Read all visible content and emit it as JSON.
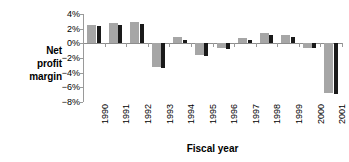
{
  "chart_data": {
    "type": "bar",
    "title": "",
    "xlabel": "Fiscal year",
    "ylabel": "Net profit margin",
    "ylabel_lines": [
      "Net",
      "profit",
      "margin"
    ],
    "categories": [
      "1990",
      "1991",
      "1992",
      "1993",
      "1994",
      "1995",
      "1996",
      "1997",
      "1998",
      "1999",
      "2000",
      "2001"
    ],
    "series": [
      {
        "name": "series-gray",
        "color": "#a6a6a6",
        "values": [
          2.5,
          2.8,
          2.9,
          -3.2,
          0.8,
          -1.6,
          -0.7,
          0.7,
          1.4,
          1.1,
          -0.6,
          -6.8
        ]
      },
      {
        "name": "series-black",
        "color": "#1a1a1a",
        "values": [
          2.3,
          2.5,
          2.6,
          -3.3,
          0.5,
          -1.7,
          -0.8,
          0.5,
          1.1,
          0.8,
          -0.7,
          -6.9
        ]
      }
    ],
    "ylim": [
      -8,
      4
    ],
    "yticks": [
      4,
      2,
      0,
      -2,
      -4,
      -6,
      -8
    ],
    "ytick_labels": [
      "4%",
      "2%",
      "0%",
      "−2%",
      "−4%",
      "−6%",
      "−8%"
    ],
    "grid": false,
    "legend": "none",
    "axis_color": "#9a9a9a"
  }
}
